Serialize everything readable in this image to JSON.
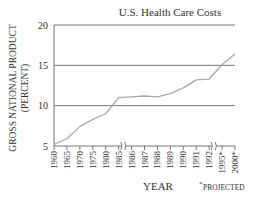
{
  "chart_data": {
    "type": "line",
    "title": "U.S. Health Care Costs",
    "xlabel": "YEAR",
    "ylabel_line1": "GROSS NATIONAL PRODUCT",
    "ylabel_line2": "(PERCENT)",
    "footnote": "PROJECTED",
    "footnote_marker": "*",
    "ylim": [
      5,
      20
    ],
    "yticks": [
      5,
      10,
      15,
      20
    ],
    "grid": "horizontal",
    "categories": [
      "1960",
      "1965",
      "1970",
      "1975",
      "1980",
      "1985",
      "1986",
      "1987",
      "1988",
      "1989",
      "1990",
      "1991",
      "1992",
      "1995*",
      "2000*"
    ],
    "axis_breaks_after": [
      "1985",
      "1992"
    ],
    "projected": [
      "1995*",
      "2000*"
    ],
    "series": [
      {
        "name": "Health care costs (% of GNP)",
        "values": [
          5.2,
          5.9,
          7.4,
          8.3,
          9.0,
          11.0,
          11.1,
          11.2,
          11.1,
          11.5,
          12.2,
          13.2,
          13.3,
          15.1,
          16.4
        ]
      }
    ],
    "colors": {
      "line": "#a8a8a8",
      "grid": "#777777",
      "axis": "#777777",
      "text": "#333333"
    }
  }
}
